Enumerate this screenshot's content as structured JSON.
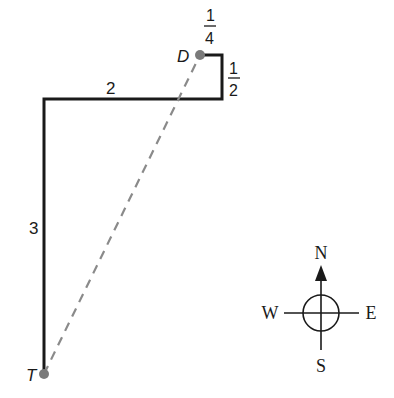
{
  "diagram": {
    "points": {
      "D": {
        "label": "D",
        "x": 200,
        "y": 55
      },
      "T": {
        "label": "T",
        "x": 44,
        "y": 374
      }
    },
    "path_segments": [
      {
        "label": "3",
        "from": "T",
        "to": "corner-nw"
      },
      {
        "label": "2",
        "from": "corner-nw",
        "to": "corner-se"
      },
      {
        "label_num": "1",
        "label_den": "2",
        "from": "corner-se",
        "to": "corner-ne"
      },
      {
        "label_num": "1",
        "label_den": "4",
        "from": "corner-ne",
        "to": "D"
      }
    ],
    "segment_labels": {
      "west_leg": "3",
      "north_leg": "2",
      "south_leg_num": "1",
      "south_leg_den": "2",
      "west_short_num": "1",
      "west_short_den": "4"
    },
    "compass": {
      "north": "N",
      "south": "S",
      "east": "E",
      "west": "W"
    },
    "colors": {
      "path": "#1a1a1a",
      "dashed": "#8a8a8a",
      "point": "#7a7a7a"
    }
  }
}
